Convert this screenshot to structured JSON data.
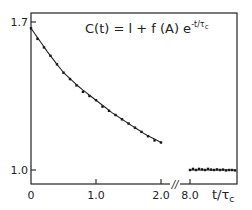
{
  "chart_data": {
    "type": "scatter",
    "title": "",
    "annotation": "C(t) = 1 + f(A) e^{-t/τc}",
    "annotation_parts": {
      "main": "C(t) = l + f (A) e",
      "superscript": "-t/τ",
      "sub": "c"
    },
    "xlabel": "t/τc",
    "xlabel_parts": {
      "main": "t/τ",
      "sub": "c"
    },
    "ylabel": "",
    "x_ticks": [
      "0",
      "1.0",
      "2.0",
      "8.0"
    ],
    "y_ticks": [
      "1.0",
      "1.7"
    ],
    "x_axis_break": {
      "between": [
        2.0,
        8.0
      ],
      "symbol": "//"
    },
    "ylim": [
      0.97,
      1.74
    ],
    "grid": false,
    "legend": null,
    "series": [
      {
        "name": "measured C(t), decay segment",
        "marker": "dot",
        "x": [
          0.0,
          0.1,
          0.2,
          0.3,
          0.4,
          0.5,
          0.6,
          0.7,
          0.8,
          0.9,
          1.0,
          1.1,
          1.2,
          1.3,
          1.4,
          1.5,
          1.6,
          1.7,
          1.8,
          1.9,
          2.0
        ],
        "values": [
          1.67,
          1.62,
          1.58,
          1.54,
          1.5,
          1.46,
          1.43,
          1.4,
          1.37,
          1.35,
          1.33,
          1.3,
          1.28,
          1.26,
          1.24,
          1.22,
          1.2,
          1.18,
          1.16,
          1.14,
          1.13
        ]
      },
      {
        "name": "fit 1 + f(A) exp(-t/τc)",
        "style": "solid line",
        "x": [
          0.0,
          0.25,
          0.5,
          0.75,
          1.0,
          1.25,
          1.5,
          1.75,
          2.0
        ],
        "values": [
          1.67,
          1.56,
          1.46,
          1.39,
          1.33,
          1.27,
          1.22,
          1.17,
          1.13
        ]
      },
      {
        "name": "baseline at long time",
        "marker": "dot",
        "x": [
          8.0,
          8.1,
          8.2,
          8.3,
          8.4,
          8.5,
          8.6,
          8.7,
          8.8,
          8.9,
          9.0,
          9.1,
          9.2,
          9.3,
          9.4,
          9.5
        ],
        "values": [
          1.0,
          1.005,
          1.0,
          1.005,
          1.003,
          1.0,
          1.005,
          1.002,
          1.0,
          1.003,
          1.0,
          1.002,
          0.998,
          1.0,
          1.0,
          0.998
        ]
      }
    ]
  }
}
